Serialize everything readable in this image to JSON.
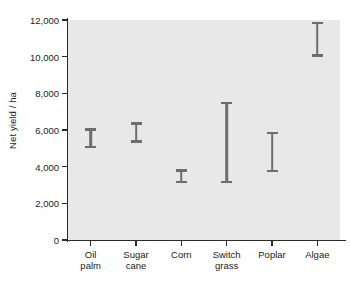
{
  "chart_data": {
    "type": "bar",
    "subtype": "range-interval",
    "title": "",
    "xlabel": "",
    "ylabel": "Net yield / ha",
    "ylim": [
      0,
      12000
    ],
    "ytick_values": [
      0,
      2000,
      4000,
      6000,
      8000,
      10000,
      12000
    ],
    "ytick_labels": [
      "0",
      "2,000",
      "4,000",
      "6,000",
      "8,000",
      "10,000",
      "12,000"
    ],
    "grid": false,
    "legend": null,
    "categories": [
      "Oil palm",
      "Sugar cane",
      "Corn",
      "Switch grass",
      "Poplar",
      "Algae"
    ],
    "category_labels": [
      [
        "Oil",
        "palm"
      ],
      [
        "Sugar",
        "cane"
      ],
      [
        "Corn"
      ],
      [
        "Switch",
        "grass"
      ],
      [
        "Poplar"
      ],
      [
        "Algae"
      ]
    ],
    "series": [
      {
        "name": "Net yield range",
        "low": [
          5000,
          5300,
          3100,
          3100,
          3700,
          10000
        ],
        "high": [
          6100,
          6430,
          3850,
          7550,
          5900,
          11900
        ]
      }
    ],
    "bar_color": "#6d6d6d",
    "plot_background": "#e8e8e8",
    "axis_color": "#2b2b2b"
  }
}
